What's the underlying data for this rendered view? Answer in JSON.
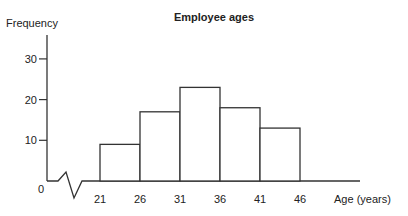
{
  "chart_data": {
    "type": "bar",
    "subtype": "histogram",
    "title": "Employee ages",
    "xlabel": "Age (years)",
    "ylabel": "Frequency",
    "categories": [
      "21-26",
      "26-31",
      "31-36",
      "36-41",
      "41-46"
    ],
    "bin_edges": [
      21,
      26,
      31,
      36,
      41,
      46
    ],
    "values": [
      9,
      17,
      23,
      18,
      13
    ],
    "y_ticks": [
      0,
      10,
      20,
      30
    ],
    "x_ticks": [
      21,
      26,
      31,
      36,
      41,
      46
    ],
    "ylim": [
      0,
      32
    ],
    "grid": false,
    "axis_break": true
  }
}
